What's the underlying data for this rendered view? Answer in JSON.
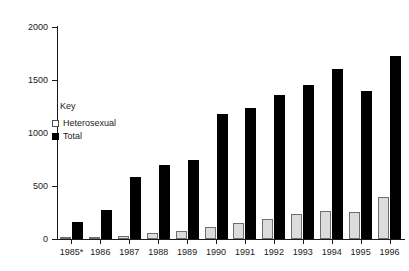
{
  "chart_data": {
    "type": "bar",
    "title": "",
    "xlabel": "",
    "ylabel": "",
    "ylim": [
      0,
      2000
    ],
    "yticks": [
      0,
      500,
      1000,
      1500,
      2000
    ],
    "grid": false,
    "legend_position": "inside-upper-left",
    "legend_title": "Key",
    "categories": [
      "1985*",
      "1986",
      "1987",
      "1988",
      "1989",
      "1990",
      "1991",
      "1992",
      "1993",
      "1994",
      "1995",
      "1996"
    ],
    "series": [
      {
        "name": "Heterosexual",
        "color": "#dcdcdc",
        "values": [
          2,
          10,
          25,
          60,
          75,
          110,
          150,
          190,
          235,
          265,
          255,
          400
        ]
      },
      {
        "name": "Total",
        "color": "#000000",
        "values": [
          160,
          275,
          585,
          695,
          745,
          1180,
          1240,
          1355,
          1450,
          1600,
          1400,
          1725
        ]
      }
    ]
  }
}
